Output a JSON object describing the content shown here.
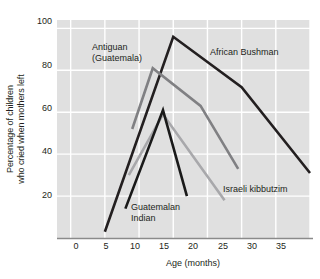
{
  "chart_data": {
    "type": "line",
    "title": "",
    "xlabel": "Age (months)",
    "ylabel": "Percentage of children who cried when mothers left",
    "xlim": [
      -2,
      35
    ],
    "ylim": [
      0,
      104
    ],
    "xticks": [
      0,
      5,
      10,
      15,
      20,
      25,
      30,
      35
    ],
    "yticks": [
      20,
      40,
      60,
      80,
      100
    ],
    "grid": true,
    "legend_position": "inline-annotations",
    "series": [
      {
        "name": "African Bushman",
        "color": "#231f20",
        "points": [
          [
            5,
            3
          ],
          [
            15,
            96
          ],
          [
            25,
            72
          ],
          [
            35,
            31
          ]
        ]
      },
      {
        "name": "Antiguan (Guatemala)",
        "color": "#808083",
        "points": [
          [
            9,
            52
          ],
          [
            12,
            81
          ],
          [
            19,
            63
          ],
          [
            24.5,
            33
          ]
        ]
      },
      {
        "name": "Israeli kibbutzim",
        "color": "#a8a8ab",
        "points": [
          [
            8.5,
            30
          ],
          [
            13.5,
            59
          ],
          [
            22.5,
            18
          ]
        ]
      },
      {
        "name": "Guatemalan Indian",
        "color": "#1a1a1a",
        "points": [
          [
            8,
            14
          ],
          [
            13.5,
            61
          ],
          [
            17,
            20
          ]
        ]
      }
    ]
  },
  "annotations": [
    {
      "id": "antiguan",
      "line1": "Antiguan",
      "line2": "(Guatemala)"
    },
    {
      "id": "african-bushman",
      "line1": "African Bushman",
      "line2": ""
    },
    {
      "id": "israeli-kibbutzim",
      "line1": "Israeli kibbutzim",
      "line2": ""
    },
    {
      "id": "guatemalan-indian",
      "line1": "Guatemalan",
      "line2": "Indian"
    }
  ],
  "axis": {
    "x_title": "Age (months)",
    "y_title_line1": "Percentage of children",
    "y_title_line2": "who cried when mothers left",
    "x_tick_labels": [
      "0",
      "5",
      "10",
      "15",
      "20",
      "25",
      "30",
      "35"
    ],
    "y_tick_labels": [
      "20",
      "40",
      "60",
      "80",
      "100"
    ]
  },
  "colors": {
    "plot_background": "#e0e0e0",
    "gridline": "#ffffff",
    "axis": "#8a8a8a",
    "text": "#231f20"
  }
}
